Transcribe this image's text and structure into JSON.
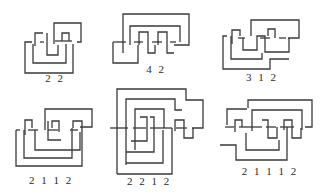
{
  "figure": {
    "stroke_color": "#3a3a3a",
    "background": "#ffffff",
    "knots": [
      {
        "label": "2 2",
        "label_pos": [
          55,
          81
        ],
        "paths": [
          "M35,46 L35,33 L43,33",
          "M47,33 L47,55 L58,55 L58,45",
          "M55,41 L72,41",
          "M62,41 L62,33 L69,33 L69,41",
          "M54,44 L54,23 L81,23 L81,42 L77,42",
          "M32,42 L25,42 L25,73 L73,73 L73,44",
          "M40,42 L44,42",
          "M33,44 L33,63 L66,63 L66,44"
        ]
      },
      {
        "label": "4 2",
        "label_pos": [
          156,
          72
        ],
        "paths": [
          "M123,53 L123,14 L189,14 L189,45 L174,45",
          "M130,45 L130,26 L180,26 L180,42",
          "M139,45 L139,32 L148,32 L148,53 L155,53 L155,45",
          "M158,45 L158,32 L167,32 L167,53 L174,53",
          "M113,42 L113,63 L138,63 L138,45",
          "M113,42 L126,42",
          "M134,42 L143,42",
          "M152,42 L162,42",
          "M170,42 L176,42"
        ]
      },
      {
        "label": "3 1 2",
        "label_pos": [
          262,
          80
        ],
        "paths": [
          "M251,36 L251,20 L299,20 L299,38 L288,38",
          "M232,44 L232,30 L240,30 L240,36",
          "M243,38 L243,50 L257,50 L257,36 L265,36 L265,52 L289,52 L289,38",
          "M260,38 L270,38",
          "M268,36 L268,29 L275,29 L275,38",
          "M279,38 L286,38",
          "M238,38 L245,38",
          "M227,36 L223,36 L223,69 L270,69 L270,59 L289,59",
          "M231,36 L231,59 L262,59 L262,53"
        ]
      },
      {
        "label": "2 1 1 2",
        "label_pos": [
          51,
          182
        ],
        "paths": [
          "M45,130 L45,109 L92,109 L92,127 L80,127",
          "M25,135 L25,120 L32,120 L32,128",
          "M35,130 L35,150 L80,150 L80,132",
          "M28,130 L38,130",
          "M48,130 L58,130",
          "M52,128 L52,121 L59,121 L59,132",
          "M48,121 L48,140 L61,140",
          "M70,130 L78,130",
          "M73,128 L73,121 L82,121 L82,160",
          "M16,130 L16,166 L82,166 L82,160",
          "M16,130 L20,130",
          "M24,130 L24,158 L72,158 L72,128"
        ]
      },
      {
        "label": "2 2 1 2",
        "label_pos": [
          149,
          184
        ],
        "paths": [
          "M117,174 L117,89 L186,89 L186,100 L203,100 L203,128 L192,128",
          "M126,165 L126,99 L175,99 L175,110 L182,110",
          "M135,150 L135,109 L164,109 L164,128",
          "M140,117 L147,117 L147,141 L131,141",
          "M150,117 L154,117 L154,152 L126,152",
          "M110,128 L128,128",
          "M133,128 L146,128",
          "M150,128 L172,128",
          "M176,128 L187,128",
          "M175,131 L175,120 L184,120 L184,138 L193,138 L193,128",
          "M172,128 L172,174 L117,174",
          "M163,130 L163,163 L126,163"
        ]
      },
      {
        "label": "2 1 1 1 2",
        "label_pos": [
          270,
          173
        ],
        "paths": [
          "M248,108 L248,100 L312,100 L312,127 L305,127",
          "M227,125 L227,109 L247,109",
          "M235,132 L235,120 L242,120 L242,127",
          "M225,127 L234,127",
          "M239,127 L262,127",
          "M252,131 L252,110 L302,110 L302,130",
          "M262,120 L268,120 L268,138 L277,138 L277,127",
          "M266,127 L276,127",
          "M280,127 L294,127",
          "M284,130 L284,120 L292,120 L292,138 L301,138 L301,128",
          "M220,145 L236,145 L236,160 L287,160 L287,127",
          "M246,133 L246,150 L279,150 L279,140"
        ]
      }
    ]
  }
}
